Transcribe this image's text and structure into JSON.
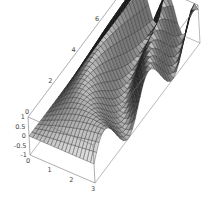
{
  "chart_data": {
    "type": "surface3d",
    "title": "",
    "xlabel": "",
    "ylabel": "",
    "zlabel": "",
    "x_range": [
      0,
      3
    ],
    "y_range": [
      0,
      9
    ],
    "z_range": [
      -1,
      1
    ],
    "x_ticks": [
      "0",
      "1",
      "2",
      "3"
    ],
    "y_ticks": [
      "0",
      "2",
      "4",
      "6",
      "8"
    ],
    "z_ticks": [
      "1",
      "0.5",
      "0",
      "-0.5",
      "-1"
    ],
    "function_hint": "sin(x*y) style oscillating surface, mesh grid, grayscale shading",
    "grid": false,
    "boxed": true,
    "mesh": true,
    "colors": {
      "surface_light": "#e8e8e8",
      "surface_dark": "#111111",
      "mesh": "#222222",
      "box": "#777777"
    }
  }
}
